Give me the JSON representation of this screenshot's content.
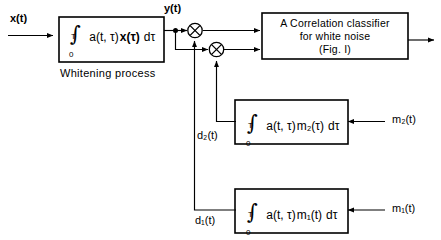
{
  "figure": {
    "type": "block-diagram"
  },
  "signals": {
    "input": "x(t)",
    "whitened": "y(t)",
    "d1": "d₁(t)",
    "d2": "d₂(t)",
    "m1": "m₁(t)",
    "m2": "m₂(t)"
  },
  "blocks": {
    "whitening": {
      "integral_lower": "0",
      "integral_upper": "T",
      "integrand_kernel": "a(t, τ)",
      "integrand_signal": "x(τ)",
      "differential": "dτ",
      "caption": "Whitening process"
    },
    "classifier": {
      "line1": "A  Correlation classifier",
      "line2": "for  white noise",
      "line3": "(Fig. I)"
    },
    "matched2": {
      "integral_lower": "0",
      "integral_upper": "T",
      "integrand_kernel": "a(t, τ)",
      "integrand_signal": "m₂(τ)",
      "differential": "dτ"
    },
    "matched1": {
      "integral_lower": "0",
      "integral_upper": "T",
      "integrand_kernel": "a(t, τ)",
      "integrand_signal": "m₁(t)",
      "differential": "dτ"
    }
  },
  "operators": {
    "multiplier_symbol": "⊗",
    "multiplier_1_name": "multiplier-top",
    "multiplier_2_name": "multiplier-lower"
  },
  "icons": {
    "junction_dot": "junction-dot-icon",
    "arrow_head": "arrow-head-icon"
  },
  "colors": {
    "line": "#000000",
    "background": "#ffffff"
  }
}
